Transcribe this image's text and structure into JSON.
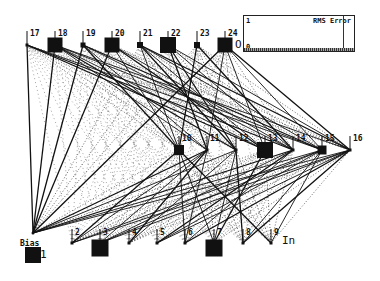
{
  "diagram": {
    "layer_labels": {
      "output": "O",
      "input": "In"
    },
    "bias": {
      "label": "Bias",
      "id": "1",
      "activation": 1.0
    },
    "output_layer": [
      {
        "id": "17",
        "activation": 0.05
      },
      {
        "id": "18",
        "activation": 0.9
      },
      {
        "id": "19",
        "activation": 0.3
      },
      {
        "id": "20",
        "activation": 0.9
      },
      {
        "id": "21",
        "activation": 0.35
      },
      {
        "id": "22",
        "activation": 0.95
      },
      {
        "id": "23",
        "activation": 0.35
      },
      {
        "id": "24",
        "activation": 0.9
      }
    ],
    "hidden_layer": [
      {
        "id": "10",
        "activation": 0.6
      },
      {
        "id": "11",
        "activation": 0.1
      },
      {
        "id": "12",
        "activation": 0.1
      },
      {
        "id": "13",
        "activation": 0.95
      },
      {
        "id": "14",
        "activation": 0.1
      },
      {
        "id": "15",
        "activation": 0.55
      },
      {
        "id": "16",
        "activation": 0.15
      }
    ],
    "input_layer": [
      {
        "id": "2",
        "activation": 0.0
      },
      {
        "id": "3",
        "activation": 1.0
      },
      {
        "id": "4",
        "activation": 0.0
      },
      {
        "id": "5",
        "activation": 0.0
      },
      {
        "id": "6",
        "activation": 0.0
      },
      {
        "id": "7",
        "activation": 1.0
      },
      {
        "id": "8",
        "activation": 0.0
      },
      {
        "id": "9",
        "activation": 0.0
      }
    ]
  },
  "rms_error_plot": {
    "title": "RMS Error",
    "y_max_label": "1",
    "y_min_label": "0"
  }
}
